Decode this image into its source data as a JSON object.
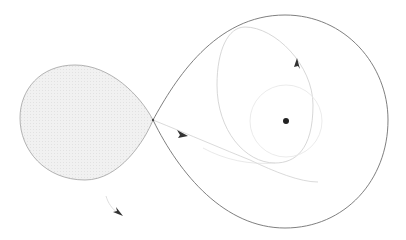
{
  "diagram": {
    "colors": {
      "background": "#ffffff",
      "lobe_fill": "#efefef",
      "lobe_stroke": "#9a9a9a",
      "big_loop_stroke": "#6e6e6e",
      "orbit_stroke": "#c8c8c8",
      "inner_ring_stroke": "#e4e4e4",
      "trajectory_stroke": "#cfcfcf",
      "arrow_fill": "#333333",
      "body_fill": "#222222"
    },
    "elements": {
      "crossing_point": {
        "x": 153,
        "y": 120
      },
      "central_body": {
        "x": 286,
        "y": 121,
        "r": 3
      },
      "arrows": [
        {
          "name": "trajectory-arrow",
          "x": 183,
          "y": 134
        },
        {
          "name": "orbit-arrow",
          "x": 299,
          "y": 63
        },
        {
          "name": "escape-arrow",
          "x": 119,
          "y": 214
        }
      ]
    }
  }
}
